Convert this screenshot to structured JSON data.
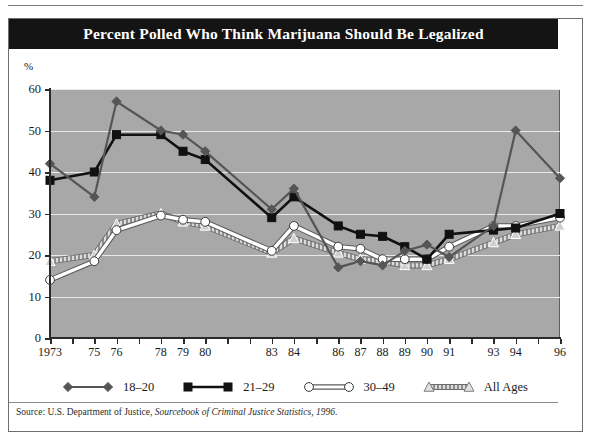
{
  "figure": {
    "title": "Percent Polled Who Think Marijuana Should Be Legalized",
    "axis_unit_label": "%",
    "source_prefix": "Source: U.S. Department of Justice, ",
    "source_italic": "Sourcebook of Criminal Justice Statistics, 1996",
    "source_suffix": "."
  },
  "colors": {
    "title_bar": "#141414",
    "plot_background": "#a8a8a8",
    "gridline": "#e9e9e9",
    "axis": "#2b2b2b",
    "series_18_20": "#555555",
    "series_21_29": "#111111",
    "series_30_49": "#ffffff",
    "series_all_ages": "#d8d8d8",
    "frame": "#6e6e6e"
  },
  "chart_data": {
    "type": "line",
    "title": "Percent Polled Who Think Marijuana Should Be Legalized",
    "xlabel": "",
    "ylabel": "%",
    "ylim": [
      0,
      60
    ],
    "yticks": [
      0,
      10,
      20,
      30,
      40,
      50,
      60
    ],
    "xlim": [
      1973,
      1996
    ],
    "grid": true,
    "legend_position": "bottom",
    "x_tick_labels": [
      "1973",
      "75",
      "76",
      "78",
      "79",
      "80",
      "83",
      "84",
      "86",
      "87",
      "88",
      "89",
      "90",
      "91",
      "93",
      "94",
      "96"
    ],
    "x_tick_years": [
      1973,
      1975,
      1976,
      1978,
      1979,
      1980,
      1983,
      1984,
      1986,
      1987,
      1988,
      1989,
      1990,
      1991,
      1993,
      1994,
      1996
    ],
    "x_all_tick_years": [
      1973,
      1974,
      1975,
      1976,
      1977,
      1978,
      1979,
      1980,
      1981,
      1982,
      1983,
      1984,
      1985,
      1986,
      1987,
      1988,
      1989,
      1990,
      1991,
      1992,
      1993,
      1994,
      1995,
      1996
    ],
    "x": [
      1973,
      1975,
      1976,
      1978,
      1979,
      1980,
      1983,
      1984,
      1986,
      1987,
      1988,
      1989,
      1990,
      1991,
      1993,
      1994,
      1996
    ],
    "series": [
      {
        "name": "18–20",
        "marker": "diamond",
        "color": "#555555",
        "values": [
          42,
          34,
          57,
          50,
          49,
          45,
          31,
          36,
          17,
          18.5,
          17.5,
          21,
          22.5,
          19.5,
          27,
          50,
          38.5
        ]
      },
      {
        "name": "21–29",
        "marker": "square",
        "color": "#111111",
        "values": [
          38,
          40,
          49,
          49,
          45,
          43,
          29,
          34,
          27,
          25,
          24.5,
          22,
          19,
          25,
          26,
          26.5,
          30
        ]
      },
      {
        "name": "30–49",
        "marker": "circle",
        "color": "#ffffff",
        "values": [
          14,
          18.5,
          26,
          29.5,
          28.5,
          28,
          21,
          27,
          22,
          21.5,
          19,
          19,
          19,
          22,
          27,
          27,
          29
        ]
      },
      {
        "name": "All Ages",
        "marker": "triangle",
        "color": "#d8d8d8",
        "values": [
          18.5,
          20,
          27.5,
          30,
          28,
          27,
          20.5,
          24,
          20.5,
          19,
          18.5,
          17.5,
          17.5,
          19,
          23,
          25,
          27
        ]
      }
    ]
  }
}
